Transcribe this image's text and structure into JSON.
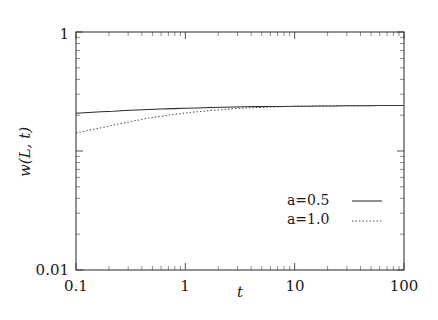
{
  "chart_data": {
    "type": "line",
    "title": "",
    "xlabel": "t",
    "ylabel": "w(L, t)",
    "xscale": "log",
    "yscale": "log",
    "xlim": [
      0.1,
      100
    ],
    "ylim": [
      0.01,
      1
    ],
    "grid": false,
    "legend_position": "lower-right",
    "xticks": [
      {
        "value": 0.1,
        "label": "0.1"
      },
      {
        "value": 1,
        "label": "1"
      },
      {
        "value": 10,
        "label": "10"
      },
      {
        "value": 100,
        "label": "100"
      }
    ],
    "yticks": [
      {
        "value": 0.01,
        "label": "0.01"
      },
      {
        "value": 1,
        "label": "1"
      }
    ],
    "series": [
      {
        "name": "a=0.5",
        "style": "solid",
        "x": [
          0.1,
          0.13,
          0.17,
          0.22,
          0.28,
          0.36,
          0.46,
          0.6,
          0.78,
          1.0,
          1.3,
          1.7,
          2.2,
          2.8,
          3.6,
          4.6,
          6.0,
          7.8,
          10.0,
          13.0,
          17.0,
          22.0,
          28.0,
          36.0,
          46.0,
          60.0,
          78.0,
          100.0
        ],
        "values": [
          0.208,
          0.211,
          0.214,
          0.216,
          0.219,
          0.221,
          0.223,
          0.225,
          0.227,
          0.229,
          0.23,
          0.232,
          0.233,
          0.234,
          0.235,
          0.236,
          0.237,
          0.237,
          0.238,
          0.238,
          0.239,
          0.239,
          0.24,
          0.24,
          0.24,
          0.241,
          0.241,
          0.241
        ]
      },
      {
        "name": "a=1.0",
        "style": "dotted",
        "x": [
          0.1,
          0.13,
          0.17,
          0.22,
          0.28,
          0.36,
          0.46,
          0.6,
          0.78,
          1.0,
          1.3,
          1.7,
          2.2,
          2.8,
          3.6,
          4.6,
          6.0,
          7.8,
          10.0,
          13.0,
          17.0,
          22.0,
          28.0,
          36.0,
          46.0,
          60.0,
          78.0,
          100.0
        ],
        "values": [
          0.142,
          0.149,
          0.157,
          0.165,
          0.173,
          0.181,
          0.189,
          0.196,
          0.203,
          0.209,
          0.214,
          0.219,
          0.223,
          0.227,
          0.23,
          0.232,
          0.234,
          0.236,
          0.237,
          0.238,
          0.239,
          0.239,
          0.24,
          0.24,
          0.24,
          0.241,
          0.241,
          0.241
        ]
      }
    ],
    "legend": [
      {
        "label": "a=0.5",
        "style": "solid"
      },
      {
        "label": "a=1.0",
        "style": "dotted"
      }
    ]
  },
  "axes": {
    "y_top_label": "1",
    "y_bottom_label": "0.01",
    "x_labels": [
      "0.1",
      "1",
      "10",
      "100"
    ],
    "x_title": "t",
    "y_title": "w(L, t)"
  },
  "legend": {
    "entry_0_label": "a=0.5",
    "entry_1_label": "a=1.0"
  }
}
